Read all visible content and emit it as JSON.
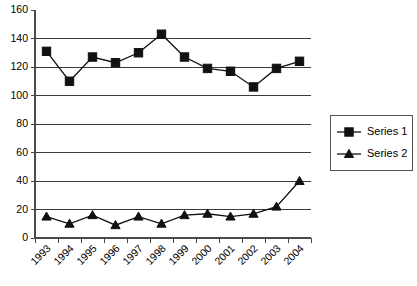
{
  "chart_data": {
    "type": "line",
    "title": "",
    "xlabel": "",
    "ylabel": "",
    "categories": [
      "1993",
      "1994",
      "1995",
      "1996",
      "1997",
      "1998",
      "1999",
      "2000",
      "2001",
      "2002",
      "2003",
      "2004"
    ],
    "series": [
      {
        "name": "Series 1",
        "marker": "square",
        "color": "#111111",
        "values": [
          131,
          110,
          127,
          123,
          130,
          143,
          127,
          119,
          117,
          106,
          119,
          124
        ]
      },
      {
        "name": "Series 2",
        "marker": "triangle",
        "color": "#111111",
        "values": [
          15,
          10,
          16,
          9,
          15,
          10,
          16,
          17,
          15,
          17,
          22,
          40
        ]
      }
    ],
    "ylim": [
      0,
      160
    ],
    "ytick_step": 20,
    "yticks": [
      0,
      20,
      40,
      60,
      80,
      100,
      120,
      140,
      160
    ],
    "grid": true,
    "grid_axis": "y",
    "legend_position": "right",
    "legend_entries": [
      "Series 1",
      "Series 2"
    ],
    "xtick_rotation": 45
  }
}
